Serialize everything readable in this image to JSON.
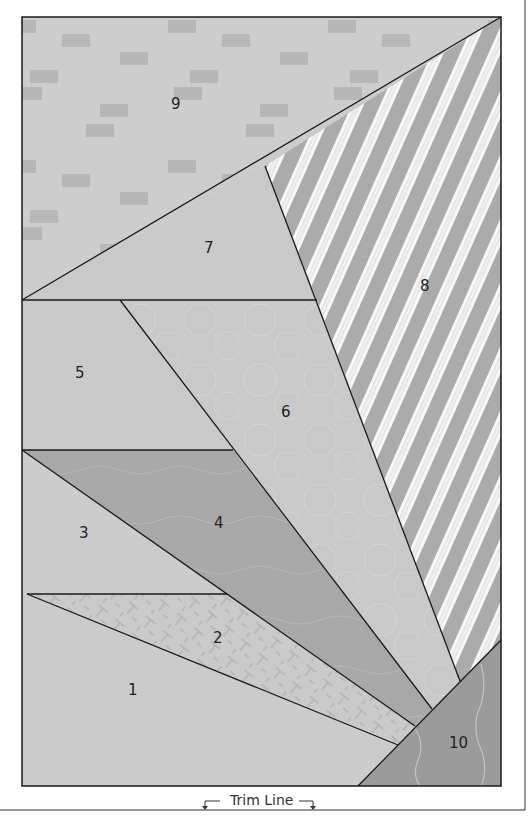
{
  "diagram": {
    "colors": {
      "outline": "#1a1a1a",
      "background_light": "#cfcfcf",
      "brick": "#b5b5b5",
      "medium": "#c8c8c8",
      "dark": "#a9a9a9",
      "darker": "#9a9a9a",
      "stripe_gray": "#ababab",
      "stripe_white": "#f7f7f7",
      "frame_line": "#555555"
    },
    "sections": [
      {
        "id": "9",
        "label": "9",
        "fabric": "brick-print"
      },
      {
        "id": "8",
        "label": "8",
        "fabric": "diagonal-stripe"
      },
      {
        "id": "7",
        "label": "7",
        "fabric": "solid-light"
      },
      {
        "id": "6",
        "label": "6",
        "fabric": "circle-print"
      },
      {
        "id": "5",
        "label": "5",
        "fabric": "solid-light"
      },
      {
        "id": "4",
        "label": "4",
        "fabric": "wave-print-dark"
      },
      {
        "id": "3",
        "label": "3",
        "fabric": "solid-light"
      },
      {
        "id": "2",
        "label": "2",
        "fabric": "crosshatch-print"
      },
      {
        "id": "1",
        "label": "1",
        "fabric": "solid-light"
      },
      {
        "id": "10",
        "label": "10",
        "fabric": "wavy-line-dark"
      }
    ],
    "trim_line": {
      "label": "Trim Line"
    }
  }
}
